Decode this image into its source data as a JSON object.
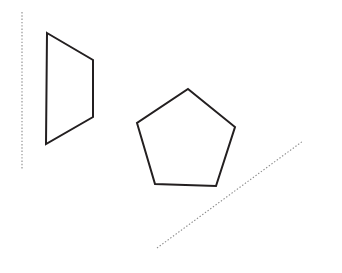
{
  "canvas": {
    "width": 342,
    "height": 273,
    "background_color": "#ffffff",
    "title": "Geometric figures with dotted reference lines"
  },
  "style": {
    "shape_stroke_color": "#231f20",
    "shape_stroke_width": 2,
    "shape_fill": "none",
    "guide_stroke_color": "#8a8a8a",
    "guide_stroke_width": 1.1,
    "guide_dash_pattern": "1.4 1.9"
  },
  "figures": [
    {
      "name": "vertical-dotted-line",
      "kind": "line",
      "line_style": "dotted",
      "color": "#8a8a8a",
      "points": "22,12 22,170",
      "x1": 22,
      "y1": 12,
      "x2": 22,
      "y2": 170
    },
    {
      "name": "quadrilateral",
      "kind": "polygon",
      "sides": 4,
      "line_style": "solid",
      "color": "#231f20",
      "points": "47,33 93,60 93,117 46,144",
      "vertices": [
        [
          47,
          33
        ],
        [
          93,
          60
        ],
        [
          93,
          117
        ],
        [
          46,
          144
        ]
      ]
    },
    {
      "name": "pentagon",
      "kind": "polygon",
      "sides": 5,
      "line_style": "solid",
      "color": "#231f20",
      "points": "188,89 235,127 216,186 155,184 137,123",
      "vertices": [
        [
          188,
          89
        ],
        [
          235,
          127
        ],
        [
          216,
          186
        ],
        [
          155,
          184
        ],
        [
          137,
          123
        ]
      ]
    },
    {
      "name": "diagonal-dotted-line",
      "kind": "line",
      "line_style": "dotted",
      "color": "#8a8a8a",
      "points": "157,248 303,141",
      "x1": 157,
      "y1": 248,
      "x2": 303,
      "y2": 141
    }
  ]
}
